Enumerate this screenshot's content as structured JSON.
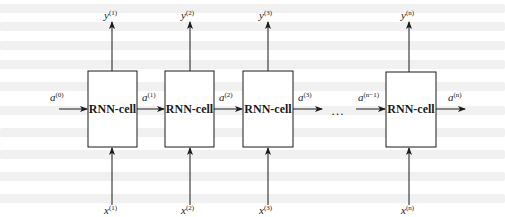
{
  "diagram": {
    "type": "unrolled-rnn",
    "cells": [
      {
        "label": "RNN-cell",
        "input_var": "x",
        "input_sup": "(1)",
        "output_var": "y",
        "output_sup": "(1)"
      },
      {
        "label": "RNN-cell",
        "input_var": "x",
        "input_sup": "(2)",
        "output_var": "y",
        "output_sup": "(2)"
      },
      {
        "label": "RNN-cell",
        "input_var": "x",
        "input_sup": "(3)",
        "output_var": "y",
        "output_sup": "(3)"
      },
      {
        "label": "RNN-cell",
        "input_var": "x",
        "input_sup": "(n)",
        "output_var": "y",
        "output_sup": "(n)"
      }
    ],
    "hidden_states": [
      {
        "var": "a",
        "sup": "(0)"
      },
      {
        "var": "a",
        "sup": "(1)"
      },
      {
        "var": "a",
        "sup": "(2)"
      },
      {
        "var": "a",
        "sup": "(3)"
      },
      {
        "var": "a",
        "sup": "(n−1)"
      },
      {
        "var": "a",
        "sup": "(n)"
      }
    ],
    "ellipsis": "…",
    "colors": {
      "stroke": "#1a1a1a",
      "background": "#ffffff"
    }
  }
}
